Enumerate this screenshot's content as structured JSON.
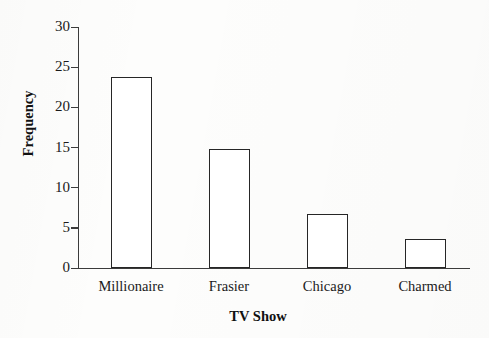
{
  "chart_data": {
    "type": "bar",
    "title": "",
    "subtitle": "",
    "xlabel": "TV Show",
    "ylabel": "Frequency",
    "categories": [
      "Millionaire",
      "Frasier",
      "Chicago",
      "Charmed"
    ],
    "values": [
      23.8,
      14.8,
      6.7,
      3.6
    ],
    "series": [
      {
        "name": "Frequency",
        "values": [
          23.8,
          14.8,
          6.7,
          3.6
        ]
      }
    ],
    "ylim": [
      0,
      30
    ],
    "y_ticks": [
      0,
      5,
      10,
      15,
      20,
      25,
      30
    ],
    "y_tick_labels": [
      "0",
      "5",
      "10",
      "15",
      "20",
      "25",
      "30"
    ],
    "grid": false,
    "legend": false,
    "legend_position": "none",
    "bar_fill_color": "#ffffff",
    "bar_edge_color": "#262626",
    "axis_color": "#3b3b3b",
    "background_color": "#fdfdfc",
    "annotations": []
  },
  "axes": {
    "y_title": "Frequency",
    "x_title": "TV Show"
  }
}
